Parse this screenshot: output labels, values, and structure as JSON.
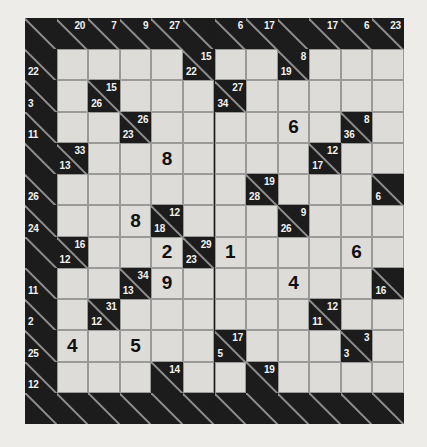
{
  "puzzle": {
    "type": "kakuro",
    "title": "Kakuro Puzzle Grid",
    "columns": 12,
    "rows": 13,
    "colors": {
      "page_background": "#eeece8",
      "block_cell": "#1c1c1c",
      "open_cell": "#dedcd8",
      "grid_line": "#9a9a98",
      "clue_text": "#f2f2f2",
      "digit_text": "#101010",
      "diagonal_stroke": "#8e8e8e"
    },
    "legend": {
      "across_clue_position": "upper-right",
      "down_clue_position": "lower-left"
    },
    "cells": [
      {
        "r": 0,
        "c": 0,
        "type": "block"
      },
      {
        "r": 0,
        "c": 1,
        "type": "block",
        "across": "20"
      },
      {
        "r": 0,
        "c": 2,
        "type": "block",
        "across": "7"
      },
      {
        "r": 0,
        "c": 3,
        "type": "block",
        "across": "9"
      },
      {
        "r": 0,
        "c": 4,
        "type": "block",
        "across": "27"
      },
      {
        "r": 0,
        "c": 5,
        "type": "block"
      },
      {
        "r": 0,
        "c": 6,
        "type": "block",
        "across": "6"
      },
      {
        "r": 0,
        "c": 7,
        "type": "block",
        "across": "17"
      },
      {
        "r": 0,
        "c": 8,
        "type": "block"
      },
      {
        "r": 0,
        "c": 9,
        "type": "block",
        "across": "17"
      },
      {
        "r": 0,
        "c": 10,
        "type": "block",
        "across": "6"
      },
      {
        "r": 0,
        "c": 11,
        "type": "block",
        "across": "23"
      },
      {
        "r": 1,
        "c": 0,
        "type": "block",
        "down": "22"
      },
      {
        "r": 1,
        "c": 1,
        "type": "open"
      },
      {
        "r": 1,
        "c": 2,
        "type": "open"
      },
      {
        "r": 1,
        "c": 3,
        "type": "open"
      },
      {
        "r": 1,
        "c": 4,
        "type": "open"
      },
      {
        "r": 1,
        "c": 5,
        "type": "block",
        "across": "15",
        "down": "22"
      },
      {
        "r": 1,
        "c": 6,
        "type": "open"
      },
      {
        "r": 1,
        "c": 7,
        "type": "open"
      },
      {
        "r": 1,
        "c": 8,
        "type": "block",
        "across": "8",
        "down": "19"
      },
      {
        "r": 1,
        "c": 9,
        "type": "open"
      },
      {
        "r": 1,
        "c": 10,
        "type": "open"
      },
      {
        "r": 1,
        "c": 11,
        "type": "open"
      },
      {
        "r": 2,
        "c": 0,
        "type": "block",
        "down": "3"
      },
      {
        "r": 2,
        "c": 1,
        "type": "open"
      },
      {
        "r": 2,
        "c": 2,
        "type": "block",
        "across": "15",
        "down": "26"
      },
      {
        "r": 2,
        "c": 3,
        "type": "open"
      },
      {
        "r": 2,
        "c": 4,
        "type": "open"
      },
      {
        "r": 2,
        "c": 5,
        "type": "open"
      },
      {
        "r": 2,
        "c": 6,
        "type": "block",
        "across": "27",
        "down": "34"
      },
      {
        "r": 2,
        "c": 7,
        "type": "open"
      },
      {
        "r": 2,
        "c": 8,
        "type": "open"
      },
      {
        "r": 2,
        "c": 9,
        "type": "open"
      },
      {
        "r": 2,
        "c": 10,
        "type": "open"
      },
      {
        "r": 2,
        "c": 11,
        "type": "open"
      },
      {
        "r": 3,
        "c": 0,
        "type": "block",
        "down": "11"
      },
      {
        "r": 3,
        "c": 1,
        "type": "open"
      },
      {
        "r": 3,
        "c": 2,
        "type": "open"
      },
      {
        "r": 3,
        "c": 3,
        "type": "block",
        "across": "26",
        "down": "23"
      },
      {
        "r": 3,
        "c": 4,
        "type": "open"
      },
      {
        "r": 3,
        "c": 5,
        "type": "open"
      },
      {
        "r": 3,
        "c": 6,
        "type": "open"
      },
      {
        "r": 3,
        "c": 7,
        "type": "open"
      },
      {
        "r": 3,
        "c": 8,
        "type": "open",
        "value": "6"
      },
      {
        "r": 3,
        "c": 9,
        "type": "open"
      },
      {
        "r": 3,
        "c": 10,
        "type": "block",
        "across": "8",
        "down": "36"
      },
      {
        "r": 3,
        "c": 11,
        "type": "open"
      },
      {
        "r": 4,
        "c": 0,
        "type": "block"
      },
      {
        "r": 4,
        "c": 1,
        "type": "block",
        "across": "33",
        "down": "13"
      },
      {
        "r": 4,
        "c": 2,
        "type": "open"
      },
      {
        "r": 4,
        "c": 3,
        "type": "open"
      },
      {
        "r": 4,
        "c": 4,
        "type": "open",
        "value": "8"
      },
      {
        "r": 4,
        "c": 5,
        "type": "open"
      },
      {
        "r": 4,
        "c": 6,
        "type": "open"
      },
      {
        "r": 4,
        "c": 7,
        "type": "open"
      },
      {
        "r": 4,
        "c": 8,
        "type": "open"
      },
      {
        "r": 4,
        "c": 9,
        "type": "block",
        "across": "12",
        "down": "17"
      },
      {
        "r": 4,
        "c": 10,
        "type": "open"
      },
      {
        "r": 4,
        "c": 11,
        "type": "open"
      },
      {
        "r": 5,
        "c": 0,
        "type": "block",
        "down": "26"
      },
      {
        "r": 5,
        "c": 1,
        "type": "open"
      },
      {
        "r": 5,
        "c": 2,
        "type": "open"
      },
      {
        "r": 5,
        "c": 3,
        "type": "open"
      },
      {
        "r": 5,
        "c": 4,
        "type": "open"
      },
      {
        "r": 5,
        "c": 5,
        "type": "open"
      },
      {
        "r": 5,
        "c": 6,
        "type": "open"
      },
      {
        "r": 5,
        "c": 7,
        "type": "block",
        "across": "19",
        "down": "28"
      },
      {
        "r": 5,
        "c": 8,
        "type": "open"
      },
      {
        "r": 5,
        "c": 9,
        "type": "open"
      },
      {
        "r": 5,
        "c": 10,
        "type": "open"
      },
      {
        "r": 5,
        "c": 11,
        "type": "block",
        "down": "6"
      },
      {
        "r": 6,
        "c": 0,
        "type": "block",
        "down": "24"
      },
      {
        "r": 6,
        "c": 1,
        "type": "open"
      },
      {
        "r": 6,
        "c": 2,
        "type": "open"
      },
      {
        "r": 6,
        "c": 3,
        "type": "open",
        "value": "8"
      },
      {
        "r": 6,
        "c": 4,
        "type": "block",
        "across": "12",
        "down": "18"
      },
      {
        "r": 6,
        "c": 5,
        "type": "open"
      },
      {
        "r": 6,
        "c": 6,
        "type": "open"
      },
      {
        "r": 6,
        "c": 7,
        "type": "open"
      },
      {
        "r": 6,
        "c": 8,
        "type": "block",
        "across": "9",
        "down": "26"
      },
      {
        "r": 6,
        "c": 9,
        "type": "open"
      },
      {
        "r": 6,
        "c": 10,
        "type": "open"
      },
      {
        "r": 6,
        "c": 11,
        "type": "open"
      },
      {
        "r": 7,
        "c": 0,
        "type": "block"
      },
      {
        "r": 7,
        "c": 1,
        "type": "block",
        "across": "16",
        "down": "12"
      },
      {
        "r": 7,
        "c": 2,
        "type": "open"
      },
      {
        "r": 7,
        "c": 3,
        "type": "open"
      },
      {
        "r": 7,
        "c": 4,
        "type": "open",
        "value": "2"
      },
      {
        "r": 7,
        "c": 5,
        "type": "block",
        "across": "29",
        "down": "23"
      },
      {
        "r": 7,
        "c": 6,
        "type": "open",
        "value": "1"
      },
      {
        "r": 7,
        "c": 7,
        "type": "open"
      },
      {
        "r": 7,
        "c": 8,
        "type": "open"
      },
      {
        "r": 7,
        "c": 9,
        "type": "open"
      },
      {
        "r": 7,
        "c": 10,
        "type": "open",
        "value": "6"
      },
      {
        "r": 7,
        "c": 11,
        "type": "open"
      },
      {
        "r": 8,
        "c": 0,
        "type": "block",
        "down": "11"
      },
      {
        "r": 8,
        "c": 1,
        "type": "open"
      },
      {
        "r": 8,
        "c": 2,
        "type": "open"
      },
      {
        "r": 8,
        "c": 3,
        "type": "block",
        "across": "34",
        "down": "13"
      },
      {
        "r": 8,
        "c": 4,
        "type": "open",
        "value": "9"
      },
      {
        "r": 8,
        "c": 5,
        "type": "open"
      },
      {
        "r": 8,
        "c": 6,
        "type": "open"
      },
      {
        "r": 8,
        "c": 7,
        "type": "open"
      },
      {
        "r": 8,
        "c": 8,
        "type": "open",
        "value": "4"
      },
      {
        "r": 8,
        "c": 9,
        "type": "open"
      },
      {
        "r": 8,
        "c": 10,
        "type": "open"
      },
      {
        "r": 8,
        "c": 11,
        "type": "block",
        "down": "16"
      },
      {
        "r": 9,
        "c": 0,
        "type": "block",
        "down": "2"
      },
      {
        "r": 9,
        "c": 1,
        "type": "open"
      },
      {
        "r": 9,
        "c": 2,
        "type": "block",
        "across": "31",
        "down": "12"
      },
      {
        "r": 9,
        "c": 3,
        "type": "open"
      },
      {
        "r": 9,
        "c": 4,
        "type": "open"
      },
      {
        "r": 9,
        "c": 5,
        "type": "open"
      },
      {
        "r": 9,
        "c": 6,
        "type": "open"
      },
      {
        "r": 9,
        "c": 7,
        "type": "open"
      },
      {
        "r": 9,
        "c": 8,
        "type": "open"
      },
      {
        "r": 9,
        "c": 9,
        "type": "block",
        "across": "12",
        "down": "11"
      },
      {
        "r": 9,
        "c": 10,
        "type": "open"
      },
      {
        "r": 9,
        "c": 11,
        "type": "open"
      },
      {
        "r": 10,
        "c": 0,
        "type": "block",
        "down": "25"
      },
      {
        "r": 10,
        "c": 1,
        "type": "open",
        "value": "4"
      },
      {
        "r": 10,
        "c": 2,
        "type": "open"
      },
      {
        "r": 10,
        "c": 3,
        "type": "open",
        "value": "5"
      },
      {
        "r": 10,
        "c": 4,
        "type": "open"
      },
      {
        "r": 10,
        "c": 5,
        "type": "open"
      },
      {
        "r": 10,
        "c": 6,
        "type": "block",
        "across": "17",
        "down": "5"
      },
      {
        "r": 10,
        "c": 7,
        "type": "open"
      },
      {
        "r": 10,
        "c": 8,
        "type": "open"
      },
      {
        "r": 10,
        "c": 9,
        "type": "open"
      },
      {
        "r": 10,
        "c": 10,
        "type": "block",
        "across": "3",
        "down": "3"
      },
      {
        "r": 10,
        "c": 11,
        "type": "open"
      },
      {
        "r": 11,
        "c": 0,
        "type": "block",
        "down": "12"
      },
      {
        "r": 11,
        "c": 1,
        "type": "open"
      },
      {
        "r": 11,
        "c": 2,
        "type": "open"
      },
      {
        "r": 11,
        "c": 3,
        "type": "open"
      },
      {
        "r": 11,
        "c": 4,
        "type": "block",
        "across": "14"
      },
      {
        "r": 11,
        "c": 5,
        "type": "open"
      },
      {
        "r": 11,
        "c": 6,
        "type": "open"
      },
      {
        "r": 11,
        "c": 7,
        "type": "block",
        "across": "19"
      },
      {
        "r": 11,
        "c": 8,
        "type": "open"
      },
      {
        "r": 11,
        "c": 9,
        "type": "open"
      },
      {
        "r": 11,
        "c": 10,
        "type": "open"
      },
      {
        "r": 11,
        "c": 11,
        "type": "open"
      },
      {
        "r": 12,
        "c": 0,
        "type": "block"
      },
      {
        "r": 12,
        "c": 1,
        "type": "block"
      },
      {
        "r": 12,
        "c": 2,
        "type": "block"
      },
      {
        "r": 12,
        "c": 3,
        "type": "block"
      },
      {
        "r": 12,
        "c": 4,
        "type": "block"
      },
      {
        "r": 12,
        "c": 5,
        "type": "block"
      },
      {
        "r": 12,
        "c": 6,
        "type": "block"
      },
      {
        "r": 12,
        "c": 7,
        "type": "block"
      },
      {
        "r": 12,
        "c": 8,
        "type": "block"
      },
      {
        "r": 12,
        "c": 9,
        "type": "block"
      },
      {
        "r": 12,
        "c": 10,
        "type": "block"
      },
      {
        "r": 12,
        "c": 11,
        "type": "block"
      }
    ]
  }
}
